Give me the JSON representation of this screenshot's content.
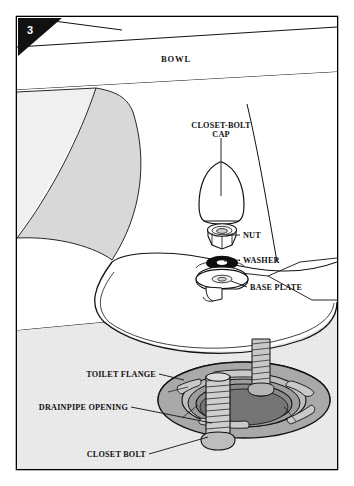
{
  "figure": {
    "type": "technical-illustration",
    "step_badge": "3",
    "frame": {
      "border_color": "#000000",
      "background": "#ffffff"
    },
    "colors": {
      "ink": "#111111",
      "floor_gray": "#e9e9e9",
      "bowl_shadow_gray": "#d8d8d8",
      "bowl_light_gray": "#f0f0f0",
      "flange_gray": "#a9a9a9",
      "flange_dark_gray": "#8d8d8d",
      "flange_light_gray": "#c4c4c4",
      "washer_black": "#0d0d0d",
      "white": "#ffffff"
    },
    "labels": [
      {
        "id": "bowl",
        "text": "BOWL",
        "x": 176,
        "y": 62,
        "anchor": "middle",
        "leader": false
      },
      {
        "id": "closet-bolt-cap",
        "text_line1": "CLOSET-BOLT",
        "text_line2": "CAP",
        "x": 221,
        "y": 128,
        "anchor": "middle",
        "leader": true
      },
      {
        "id": "nut",
        "text": "NUT",
        "x": 243,
        "y": 238,
        "anchor": "start",
        "leader": true
      },
      {
        "id": "washer",
        "text": "WASHER",
        "x": 243,
        "y": 263,
        "anchor": "start",
        "leader": true
      },
      {
        "id": "base-plate",
        "text": "BASE PLATE",
        "x": 250,
        "y": 290,
        "anchor": "start",
        "leader": true
      },
      {
        "id": "toilet-flange",
        "text": "TOILET FLANGE",
        "x": 156,
        "y": 377,
        "anchor": "end",
        "leader": true
      },
      {
        "id": "drainpipe-opening",
        "text": "DRAINPIPE OPENING",
        "x": 128,
        "y": 410,
        "anchor": "end",
        "leader": true
      },
      {
        "id": "closet-bolt",
        "text": "CLOSET BOLT",
        "x": 146,
        "y": 457,
        "anchor": "end",
        "leader": true
      }
    ],
    "parts": [
      {
        "name": "bowl",
        "description": "Toilet bowl body, white with gray shaded side panels"
      },
      {
        "name": "closet-bolt-cap",
        "description": "Dome-shaped white plastic cap"
      },
      {
        "name": "nut",
        "description": "Hex nut"
      },
      {
        "name": "washer",
        "description": "Black flat washer"
      },
      {
        "name": "base-plate",
        "description": "Round metal base plate with stem"
      },
      {
        "name": "toilet-flange",
        "description": "Gray cast flange ring with slotted bolt openings"
      },
      {
        "name": "drainpipe-opening",
        "description": "Central circular drain opening in flange"
      },
      {
        "name": "closet-bolt",
        "description": "Threaded closet bolt standing in flange slot"
      }
    ]
  }
}
